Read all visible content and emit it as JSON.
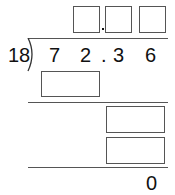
{
  "problem": {
    "divisor": "18",
    "dividend_digits": [
      "7",
      "2",
      ".",
      "3",
      "6"
    ],
    "quotient_boxes": [
      "",
      ".",
      "",
      ""
    ],
    "step1_box": "",
    "step2_boxes": [
      "",
      ""
    ],
    "remainder": "0"
  }
}
